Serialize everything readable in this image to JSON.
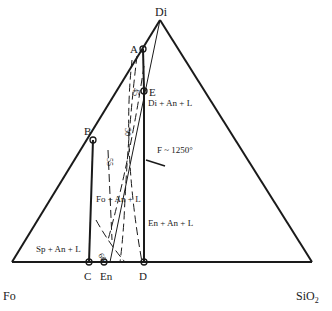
{
  "diagram": {
    "title": "",
    "type": "ternary-phase-diagram",
    "vertices": {
      "top": "Di",
      "left": "Fo",
      "right": "SiO2"
    },
    "points": {
      "A": "A",
      "B": "B",
      "C": "C",
      "D": "D",
      "E": "E",
      "En": "En"
    },
    "annotation_F": "F ~ 1250°",
    "fields": {
      "di_an_l": "Di + An + L",
      "fo_an_l": "Fo + An + L",
      "en_an_l": "En + An + L",
      "sp_an_l": "Sp + An + L"
    },
    "isopleths": [
      "45",
      "50",
      "55",
      "60"
    ],
    "colors": {
      "line": "#1a1a1a",
      "background": "#ffffff"
    }
  }
}
